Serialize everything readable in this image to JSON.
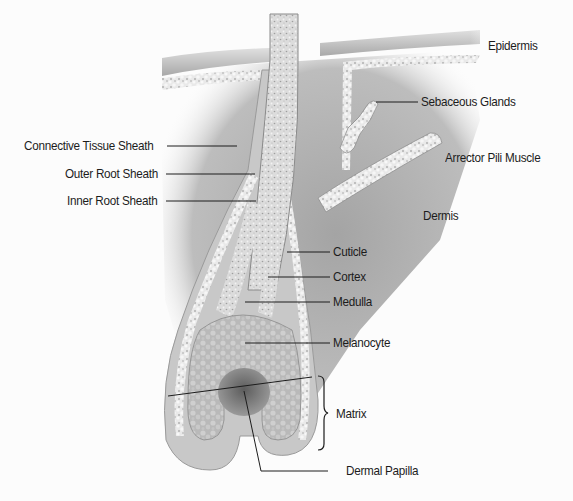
{
  "diagram": {
    "style": "grayscale anatomical illustration",
    "colors": {
      "background": "#fcfcfc",
      "dermis": "#a9a9a9",
      "skin_surface": "#bdbdbd",
      "hair_shaft": "#d8d8d8",
      "texture_cells": "#efefef",
      "dermal_papilla": "#6e6e6e",
      "label_text": "#1c1c1c",
      "leader_line": "#1c1c1c"
    },
    "labels": {
      "epidermis": "Epidermis",
      "sebaceous_glands": "Sebaceous Glands",
      "connective_tissue_sheath": "Connective Tissue Sheath",
      "arrector_pili_muscle": "Arrector Pili Muscle",
      "outer_root_sheath": "Outer Root Sheath",
      "inner_root_sheath": "Inner Root Sheath",
      "dermis": "Dermis",
      "cuticle": "Cuticle",
      "cortex": "Cortex",
      "medulla": "Medulla",
      "melanocyte": "Melanocyte",
      "matrix": "Matrix",
      "dermal_papilla": "Dermal Papilla"
    },
    "structures": [
      "hair-shaft",
      "epidermis",
      "dermis",
      "sebaceous-gland",
      "arrector-pili-muscle",
      "connective-tissue-sheath",
      "outer-root-sheath",
      "inner-root-sheath",
      "cuticle",
      "cortex",
      "medulla",
      "melanocyte",
      "matrix",
      "dermal-papilla",
      "hair-bulb"
    ]
  }
}
